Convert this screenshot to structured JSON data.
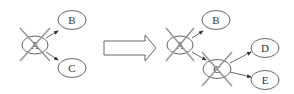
{
  "diagram": {
    "left_graph": {
      "nodes": [
        {
          "id": "A",
          "label": "A",
          "crossed": true
        },
        {
          "id": "B",
          "label": "B",
          "crossed": false
        },
        {
          "id": "C",
          "label": "C",
          "crossed": false
        }
      ],
      "edges": [
        {
          "from": "A",
          "to": "B"
        },
        {
          "from": "A",
          "to": "C"
        }
      ]
    },
    "transition_arrow": {
      "direction": "right",
      "style": "hollow block arrow"
    },
    "right_graph": {
      "nodes": [
        {
          "id": "A",
          "label": "A",
          "crossed": true
        },
        {
          "id": "B",
          "label": "B",
          "crossed": false
        },
        {
          "id": "C",
          "label": "C",
          "crossed": true
        },
        {
          "id": "D",
          "label": "D",
          "crossed": false
        },
        {
          "id": "E",
          "label": "E",
          "crossed": false
        }
      ],
      "edges": [
        {
          "from": "A",
          "to": "B"
        },
        {
          "from": "A",
          "to": "C"
        },
        {
          "from": "C",
          "to": "D"
        },
        {
          "from": "C",
          "to": "E"
        }
      ]
    },
    "colors": {
      "stroke": "#555555",
      "cross": "#999999",
      "background": "#ffffff"
    }
  }
}
